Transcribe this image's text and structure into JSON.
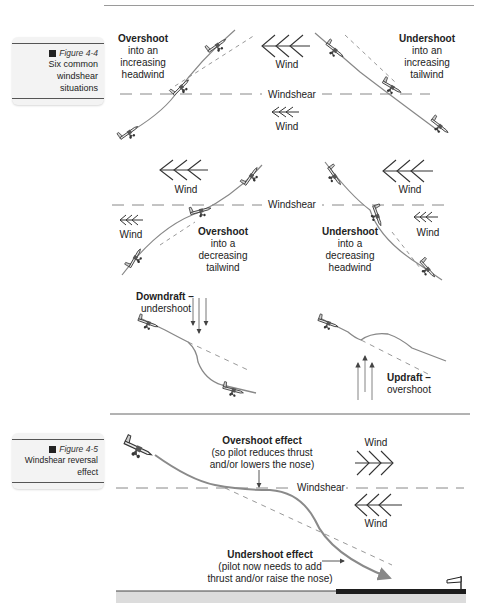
{
  "header": {
    "running_text": "Windshear and Microburst"
  },
  "figure_4_4": {
    "number": "Figure 4-4",
    "title_line1": "Six common",
    "title_line2": "windshear situations",
    "panels": [
      {
        "id": "overshoot-increasing-headwind",
        "title": "Overshoot",
        "line2": "into an",
        "line3": "increasing",
        "line4": "headwind"
      },
      {
        "id": "undershoot-increasing-tailwind",
        "title": "Undershoot",
        "line2": "into an",
        "line3": "increasing",
        "line4": "tailwind"
      },
      {
        "id": "overshoot-decreasing-tailwind",
        "title": "Overshoot",
        "line2": "into a",
        "line3": "decreasing",
        "line4": "tailwind"
      },
      {
        "id": "undershoot-decreasing-headwind",
        "title": "Undershoot",
        "line2": "into a",
        "line3": "decreasing",
        "line4": "headwind"
      },
      {
        "id": "downdraft-undershoot",
        "title": "Downdraft –",
        "line2": "undershoot"
      },
      {
        "id": "updraft-overshoot",
        "title": "Updraft –",
        "line2": "overshoot"
      }
    ],
    "labels": {
      "wind": "Wind",
      "windshear": "Windshear"
    }
  },
  "figure_4_5": {
    "number": "Figure 4-5",
    "title": "Windshear reversal effect",
    "overshoot_title": "Overshoot effect",
    "overshoot_line2": "(so pilot reduces thrust",
    "overshoot_line3": "and/or lowers the nose)",
    "undershoot_title": "Undershoot effect",
    "undershoot_line2": "(pilot now needs to add",
    "undershoot_line3": "thrust and/or raise the nose)",
    "wind": "Wind",
    "windshear": "Windshear"
  },
  "colors": {
    "flight_path": "#8a8a8a",
    "dashed_path": "#9a9a9a",
    "arrow": "#555555",
    "runway": "#222222",
    "ground": "#d9d9d9"
  }
}
